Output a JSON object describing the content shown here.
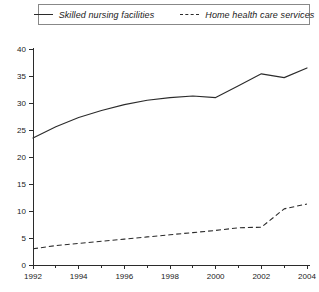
{
  "chart_data": {
    "type": "line",
    "title": "",
    "subtitle": "",
    "xlabel": "",
    "ylabel": "",
    "xlim": [
      1992,
      2004
    ],
    "ylim": [
      0,
      40
    ],
    "grid": false,
    "legend_position": "top",
    "x": [
      1992,
      1993,
      1994,
      1995,
      1996,
      1997,
      1998,
      1999,
      2000,
      2001,
      2002,
      2003,
      2004
    ],
    "xtick_labels": [
      "1992",
      "1994",
      "1996",
      "1998",
      "2000",
      "2002",
      "2004"
    ],
    "xtick_values": [
      1992,
      1994,
      1996,
      1998,
      2000,
      2002,
      2004
    ],
    "xtick_minor_values": [
      1993,
      1995,
      1997,
      1999,
      2001,
      2003
    ],
    "ytick_labels": [
      "0",
      "5",
      "10",
      "15",
      "20",
      "25",
      "30",
      "35",
      "40"
    ],
    "ytick_values": [
      0,
      5,
      10,
      15,
      20,
      25,
      30,
      35,
      40
    ],
    "series": [
      {
        "name": "Skilled nursing facilities",
        "style": "solid",
        "color": "#2b2b2b",
        "values": [
          23.5,
          25.6,
          27.3,
          28.6,
          29.7,
          30.5,
          31.0,
          31.3,
          31.0,
          33.2,
          35.4,
          34.7,
          36.5
        ]
      },
      {
        "name": "Home health care services",
        "style": "dashed",
        "color": "#2b2b2b",
        "values": [
          3.0,
          3.6,
          4.0,
          4.4,
          4.8,
          5.2,
          5.6,
          6.0,
          6.4,
          6.9,
          7.0,
          10.4,
          11.3
        ]
      }
    ]
  },
  "legend": {
    "entries": [
      {
        "label": "Skilled nursing facilities",
        "swatch": "solid-line-swatch"
      },
      {
        "label": "Home health care services",
        "swatch": "dashed-line-swatch"
      }
    ]
  }
}
